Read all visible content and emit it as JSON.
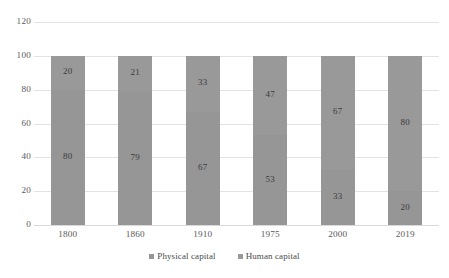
{
  "chart_data": {
    "type": "bar",
    "stacked": true,
    "title": "",
    "subtitle": "",
    "xlabel": "",
    "ylabel": "",
    "categories": [
      "1800",
      "1860",
      "1910",
      "1975",
      "2000",
      "2019"
    ],
    "series": [
      {
        "name": "Physical capital",
        "values": [
          80,
          79,
          67,
          53,
          33,
          20
        ],
        "color": "#969696"
      },
      {
        "name": "Human capital",
        "values": [
          20,
          21,
          33,
          47,
          67,
          80
        ],
        "color": "#999999"
      }
    ],
    "ylim": [
      0,
      120
    ],
    "yticks": [
      "0",
      "20",
      "40",
      "60",
      "80",
      "100",
      "120"
    ],
    "ytick_values": [
      0,
      20,
      40,
      60,
      80,
      100,
      120
    ],
    "grid": true,
    "legend_position": "bottom",
    "data_labels": true,
    "stack_order_bottom_to_top": [
      "Physical capital",
      "Human capital"
    ]
  },
  "legend": {
    "items": [
      {
        "label": "Physical capital",
        "swatch": "legend-swatch-physical"
      },
      {
        "label": "Human capital",
        "swatch": "legend-swatch-human"
      }
    ]
  },
  "colors": {
    "bar_physical": "#969696",
    "bar_human": "#999999",
    "gridline": "#e3e3e3",
    "axis_text": "#5a5a5a",
    "label_text": "#3a3a3a",
    "background": "#ffffff"
  }
}
